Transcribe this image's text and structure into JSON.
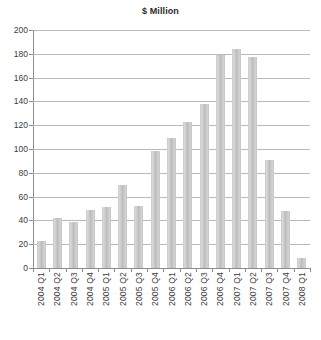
{
  "chart_data": {
    "type": "bar",
    "title": "$ Million",
    "xlabel": "",
    "ylabel": "",
    "ylim": [
      0,
      200
    ],
    "ytick_step": 20,
    "grid": true,
    "legend": "none",
    "bar_color": "#c6c6c6",
    "categories": [
      "2004 Q1",
      "2004 Q2",
      "2004 Q3",
      "2004 Q4",
      "2005 Q1",
      "2005 Q2",
      "2005 Q3",
      "2005 Q4",
      "2006 Q1",
      "2006 Q2",
      "2006 Q3",
      "2006 Q4",
      "2007 Q1",
      "2007 Q2",
      "2007 Q3",
      "2007 Q4",
      "2008 Q1"
    ],
    "values": [
      23,
      42,
      39,
      49,
      51,
      70,
      52,
      98,
      109,
      123,
      138,
      179,
      184,
      177,
      91,
      48,
      8
    ],
    "yticks": [
      0,
      20,
      40,
      60,
      80,
      100,
      120,
      140,
      160,
      180,
      200
    ],
    "ytick_labels": [
      "0",
      "20",
      "40",
      "60",
      "80",
      "100",
      "120",
      "140",
      "160",
      "180",
      "200"
    ]
  }
}
